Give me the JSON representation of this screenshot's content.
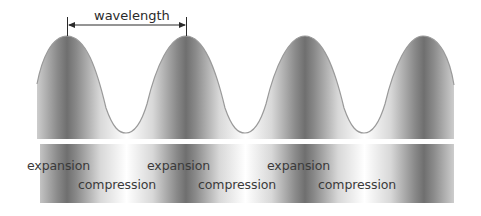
{
  "diagram": {
    "title": "wavelength",
    "labels": {
      "expansion": [
        "expansion",
        "expansion",
        "expansion"
      ],
      "compression": [
        "compression",
        "compression",
        "compression"
      ]
    },
    "colors": {
      "background": "#ffffff",
      "dark_band": "#6e6e6e",
      "light_band": "#ffffff",
      "curve_stroke": "#9a9a9a",
      "arrow": "#2a2a2a",
      "text": "#3a3a3a"
    },
    "wave": {
      "peaks_x": [
        67,
        186,
        305,
        423
      ],
      "peak_y": 36,
      "trough_y": 133,
      "period_px": 119
    }
  }
}
